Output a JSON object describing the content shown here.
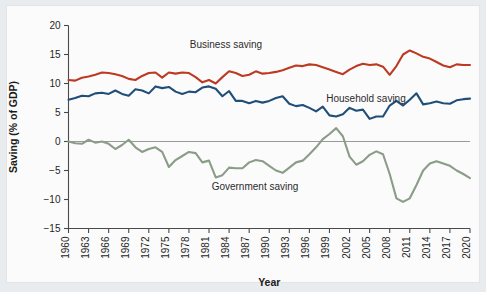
{
  "figure": {
    "background_color": "#e9ecee",
    "card_color": "#fbfbfb"
  },
  "chart_data": {
    "type": "line",
    "title": "",
    "xlabel": "Year",
    "ylabel": "Saving (% of GDP)",
    "xlim": [
      1960,
      2020
    ],
    "ylim": [
      -15,
      20
    ],
    "yticks": [
      -15,
      -10,
      -5,
      0,
      5,
      10,
      15,
      20
    ],
    "ytick_labels": [
      "−15",
      "−10",
      "−5",
      "0",
      "5",
      "10",
      "15",
      "20"
    ],
    "xticks": [
      1960,
      1963,
      1966,
      1969,
      1972,
      1975,
      1978,
      1981,
      1984,
      1987,
      1990,
      1993,
      1996,
      1999,
      2002,
      2005,
      2008,
      2011,
      2014,
      2017,
      2020
    ],
    "xtick_labels": [
      "1960",
      "1963",
      "1966",
      "1969",
      "1972",
      "1975",
      "1978",
      "1981",
      "1984",
      "1987",
      "1990",
      "1993",
      "1996",
      "1999",
      "2002",
      "2005",
      "2008",
      "2011",
      "2014",
      "2017",
      "2020"
    ],
    "grid": false,
    "legend": "inline-annotations",
    "zero_line": true,
    "x": [
      1960,
      1961,
      1962,
      1963,
      1964,
      1965,
      1966,
      1967,
      1968,
      1969,
      1970,
      1971,
      1972,
      1973,
      1974,
      1975,
      1976,
      1977,
      1978,
      1979,
      1980,
      1981,
      1982,
      1983,
      1984,
      1985,
      1986,
      1987,
      1988,
      1989,
      1990,
      1991,
      1992,
      1993,
      1994,
      1995,
      1996,
      1997,
      1998,
      1999,
      2000,
      2001,
      2002,
      2003,
      2004,
      2005,
      2006,
      2007,
      2008,
      2009,
      2010,
      2011,
      2012,
      2013,
      2014,
      2015,
      2016,
      2017,
      2018,
      2019,
      2020
    ],
    "series": [
      {
        "name": "Business saving",
        "color": "#bc3a22",
        "annotation": "Business saving",
        "values": [
          10.6,
          10.5,
          11.0,
          11.2,
          11.5,
          11.9,
          11.8,
          11.6,
          11.3,
          10.8,
          10.6,
          11.3,
          11.8,
          11.9,
          11.0,
          11.9,
          11.7,
          11.9,
          11.8,
          11.1,
          10.2,
          10.6,
          10.0,
          11.1,
          12.1,
          11.8,
          11.3,
          11.5,
          12.1,
          11.7,
          11.8,
          12.0,
          12.3,
          12.7,
          13.1,
          13.0,
          13.3,
          13.2,
          12.8,
          12.4,
          12.0,
          11.6,
          12.4,
          13.0,
          13.4,
          13.2,
          13.3,
          12.9,
          11.5,
          13.0,
          15.0,
          15.7,
          15.2,
          14.6,
          14.3,
          13.7,
          13.1,
          12.8,
          13.3,
          13.2,
          13.2
        ]
      },
      {
        "name": "Household saving",
        "color": "#1f4e79",
        "annotation": "Household saving",
        "values": [
          7.2,
          7.5,
          7.9,
          7.8,
          8.3,
          8.4,
          8.2,
          8.8,
          8.2,
          7.9,
          9.0,
          8.8,
          8.3,
          9.5,
          9.2,
          9.4,
          8.6,
          8.2,
          8.6,
          8.5,
          9.3,
          9.5,
          9.1,
          7.8,
          8.7,
          7.0,
          7.0,
          6.6,
          7.0,
          6.7,
          7.0,
          7.5,
          7.8,
          6.5,
          6.1,
          6.3,
          5.8,
          5.2,
          6.0,
          4.5,
          4.3,
          4.7,
          5.8,
          5.3,
          5.5,
          3.9,
          4.3,
          4.3,
          6.2,
          7.0,
          6.2,
          7.2,
          8.3,
          6.4,
          6.6,
          6.9,
          6.6,
          6.5,
          7.1,
          7.3,
          7.4
        ]
      },
      {
        "name": "Government saving",
        "color": "#8b9c88",
        "annotation": "Government saving",
        "values": [
          0.0,
          -0.3,
          -0.4,
          0.3,
          -0.2,
          0.0,
          -0.4,
          -1.3,
          -0.6,
          0.3,
          -1.0,
          -1.8,
          -1.3,
          -1.0,
          -1.8,
          -4.4,
          -3.2,
          -2.5,
          -1.8,
          -2.0,
          -3.6,
          -3.3,
          -6.2,
          -5.8,
          -4.5,
          -4.6,
          -4.6,
          -3.6,
          -3.2,
          -3.4,
          -4.2,
          -5.0,
          -5.4,
          -4.5,
          -3.6,
          -3.3,
          -2.2,
          -1.0,
          0.4,
          1.3,
          2.3,
          0.9,
          -2.6,
          -4.0,
          -3.4,
          -2.3,
          -1.7,
          -2.2,
          -5.6,
          -9.8,
          -10.4,
          -9.8,
          -7.5,
          -5.0,
          -3.8,
          -3.4,
          -3.8,
          -4.2,
          -5.0,
          -5.6,
          -6.3
        ]
      }
    ],
    "annotations": [
      {
        "text": "Business saving",
        "x_px": 226,
        "y_px": 48
      },
      {
        "text": "Household saving",
        "x_px": 366,
        "y_px": 102
      },
      {
        "text": "Government saving",
        "x_px": 255,
        "y_px": 190
      }
    ]
  }
}
